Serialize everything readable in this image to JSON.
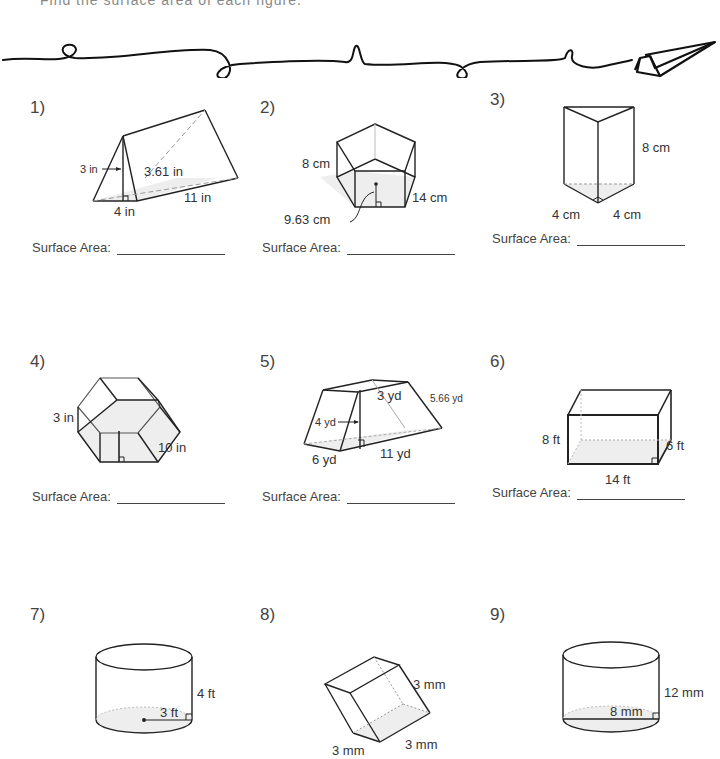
{
  "header": {
    "instruction_cropped": "Find the surface area of each figure."
  },
  "answer_label": "Surface Area:",
  "problems": [
    {
      "number": "1)",
      "shape": "triangular prism",
      "labels": {
        "height": "3 in",
        "slant": "3.61 in",
        "base": "4 in",
        "length": "11 in"
      }
    },
    {
      "number": "2)",
      "shape": "pentagonal prism",
      "labels": {
        "side": "8 cm",
        "apothem": "9.63 cm",
        "height": "14 cm"
      }
    },
    {
      "number": "3)",
      "shape": "right triangular prism",
      "labels": {
        "height": "8 cm",
        "leg_a": "4 cm",
        "leg_b": "4 cm"
      }
    },
    {
      "number": "4)",
      "shape": "hexagonal prism",
      "labels": {
        "side": "3 in",
        "length": "10 in"
      }
    },
    {
      "number": "5)",
      "shape": "trapezoidal prism",
      "labels": {
        "height": "4 yd",
        "top": "3 yd",
        "slant": "5.66 yd",
        "bottom": "6 yd",
        "length": "11 yd"
      }
    },
    {
      "number": "6)",
      "shape": "rectangular prism",
      "labels": {
        "height": "8 ft",
        "length": "14 ft",
        "width": "6 ft"
      }
    },
    {
      "number": "7)",
      "shape": "cylinder",
      "labels": {
        "height": "4 ft",
        "radius": "3 ft"
      }
    },
    {
      "number": "8)",
      "shape": "cube",
      "labels": {
        "a": "3 mm",
        "b": "3 mm",
        "c": "3 mm"
      }
    },
    {
      "number": "9)",
      "shape": "cylinder",
      "labels": {
        "height": "12 mm",
        "diameter": "8 mm"
      }
    }
  ]
}
